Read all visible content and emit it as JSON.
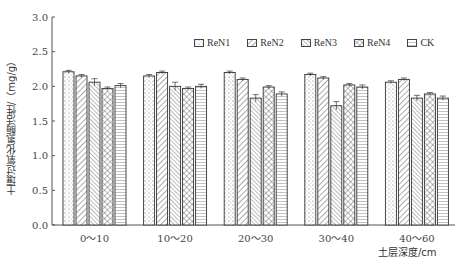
{
  "chart_data": {
    "type": "bar",
    "title": "",
    "xlabel": "土层深度/cm",
    "ylabel": "土壤过氧化氢酶活性/（mg/g）",
    "ylim": [
      0,
      3.0
    ],
    "yticks": [
      "0.0",
      "0.5",
      "1.0",
      "1.5",
      "2.0",
      "2.5",
      "3.0"
    ],
    "categories": [
      "0～10",
      "10～20",
      "20～30",
      "30～40",
      "40～60"
    ],
    "series": [
      {
        "name": "ReN1",
        "values": [
          2.21,
          2.15,
          2.2,
          2.17,
          2.06
        ],
        "errors": [
          0.02,
          0.02,
          0.02,
          0.02,
          0.02
        ]
      },
      {
        "name": "ReN2",
        "values": [
          2.15,
          2.2,
          2.1,
          2.12,
          2.1
        ],
        "errors": [
          0.02,
          0.02,
          0.02,
          0.02,
          0.02
        ]
      },
      {
        "name": "ReN3",
        "values": [
          2.06,
          2.0,
          1.83,
          1.72,
          1.83
        ],
        "errors": [
          0.05,
          0.06,
          0.05,
          0.06,
          0.04
        ]
      },
      {
        "name": "ReN4",
        "values": [
          1.97,
          1.97,
          1.99,
          2.02,
          1.89
        ],
        "errors": [
          0.02,
          0.02,
          0.02,
          0.02,
          0.02
        ]
      },
      {
        "name": "CK",
        "values": [
          2.01,
          2.0,
          1.89,
          1.99,
          1.83
        ],
        "errors": [
          0.03,
          0.03,
          0.03,
          0.03,
          0.03
        ]
      }
    ],
    "legend_position": "top-right",
    "grid": false
  }
}
